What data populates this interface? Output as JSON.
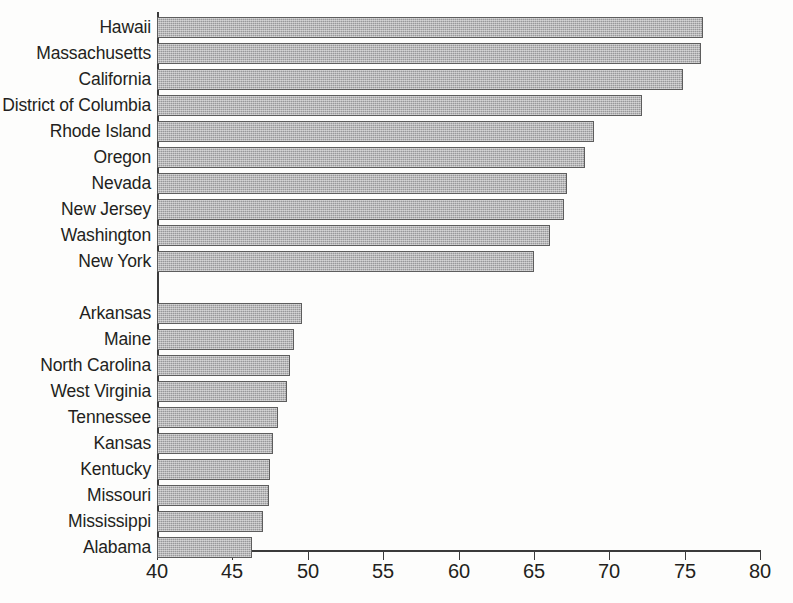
{
  "chart_data": {
    "type": "bar",
    "orientation": "horizontal",
    "title": "",
    "subtitle": "",
    "xlabel": "",
    "ylabel": "",
    "xlim": [
      40,
      80
    ],
    "xticks": [
      40,
      45,
      50,
      55,
      60,
      65,
      70,
      75,
      80
    ],
    "xtick_labels": [
      "40",
      "45",
      "50",
      "55",
      "60",
      "65",
      "70",
      "75",
      "80"
    ],
    "grid": false,
    "legend": null,
    "bar_color": "#98989a",
    "bar_edge_color": "#5d5d5d",
    "axis_color": "#3b3b3b",
    "groups": [
      {
        "name": "top-ten",
        "categories": [
          "Hawaii",
          "Massachusetts",
          "California",
          "District of Columbia",
          "Rhode Island",
          "Oregon",
          "Nevada",
          "New Jersey",
          "Washington",
          "New York"
        ],
        "values": [
          76.2,
          76.1,
          74.9,
          72.2,
          69.0,
          68.4,
          67.2,
          67.0,
          66.1,
          65.0
        ]
      },
      {
        "name": "bottom-ten",
        "categories": [
          "Arkansas",
          "Maine",
          "North Carolina",
          "West Virginia",
          "Tennessee",
          "Kansas",
          "Kentucky",
          "Missouri",
          "Mississippi",
          "Alabama"
        ],
        "values": [
          49.6,
          49.1,
          48.8,
          48.6,
          48.0,
          47.7,
          47.5,
          47.4,
          47.0,
          46.3
        ]
      }
    ],
    "categories": [
      "Hawaii",
      "Massachusetts",
      "California",
      "District of Columbia",
      "Rhode Island",
      "Oregon",
      "Nevada",
      "New Jersey",
      "Washington",
      "New York",
      "Arkansas",
      "Maine",
      "North Carolina",
      "West Virginia",
      "Tennessee",
      "Kansas",
      "Kentucky",
      "Missouri",
      "Mississippi",
      "Alabama"
    ],
    "values": [
      76.2,
      76.1,
      74.9,
      72.2,
      69.0,
      68.4,
      67.2,
      67.0,
      66.1,
      65.0,
      49.6,
      49.1,
      48.8,
      48.6,
      48.0,
      47.7,
      47.5,
      47.4,
      47.0,
      46.3
    ]
  }
}
